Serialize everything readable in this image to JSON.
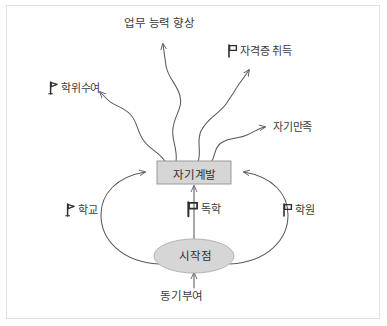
{
  "diagram": {
    "background_color": "#ffffff",
    "frame_border_color": "#e2e2e2",
    "line_color": "#5a5a5a",
    "node_fill_color": "#d6d6d6",
    "node_stroke_color": "#8c8c8c",
    "text_color": "#3b3b3b",
    "nodes": [
      {
        "id": "self-development",
        "label": "자기계발",
        "shape": "rectangle",
        "fill": "#d6d6d6"
      },
      {
        "id": "starting-point",
        "label": "시작점",
        "shape": "ellipse",
        "fill": "#d6d6d6"
      }
    ],
    "outcomes": [
      {
        "id": "work-ability",
        "label": "업무 능력 향상",
        "icon": "none"
      },
      {
        "id": "certificate",
        "label": "자격증 취득",
        "icon": "flag-icon"
      },
      {
        "id": "degree",
        "label": "학위수여",
        "icon": "flag-icon"
      },
      {
        "id": "self-satisfaction",
        "label": "자기만족",
        "icon": "none"
      }
    ],
    "methods": [
      {
        "id": "school",
        "label": "학교",
        "icon": "flag-icon"
      },
      {
        "id": "self-study",
        "label": "독학",
        "icon": "flag-icon"
      },
      {
        "id": "academy",
        "label": "학원",
        "icon": "flag-icon"
      }
    ],
    "input": {
      "id": "motivation",
      "label": "동기부여",
      "icon": "none"
    }
  }
}
